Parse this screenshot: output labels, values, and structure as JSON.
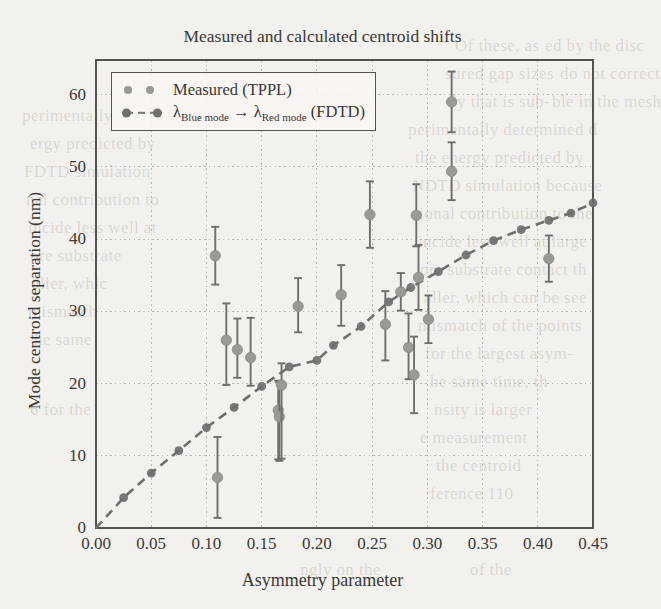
{
  "figure": {
    "title": "Measured and calculated centroid shifts",
    "xlabel": "Asymmetry parameter",
    "ylabel": "Mode centroid separation (nm)"
  },
  "legend": {
    "position": "upper-left",
    "entries": [
      {
        "label": "Measured (TPPL)",
        "marker": "circle",
        "color": "#9a9995"
      },
      {
        "label_pre": "λ",
        "label_sub1": "Blue mode",
        "label_mid": " → ",
        "label_lam2": "λ",
        "label_sub2": "Red mode",
        "label_post": " (FDTD)",
        "marker": "dashed-line-circle",
        "color": "#6f6e6b"
      }
    ]
  },
  "axes": {
    "xticks": [
      "0.00",
      "0.05",
      "0.10",
      "0.15",
      "0.20",
      "0.25",
      "0.30",
      "0.35",
      "0.40",
      "0.45"
    ],
    "yticks": [
      "0",
      "10",
      "20",
      "30",
      "40",
      "50",
      "60"
    ]
  },
  "colors": {
    "page_background": "#f3f1ed",
    "measured_marker": "#9a9995",
    "errorbar": "#6f6e6b",
    "fdtd_marker": "#6f6e6b",
    "fdtd_line": "#77766f",
    "frame": "#55534f",
    "grid": "#b9b7b1",
    "text": "#3a3936"
  },
  "chart_data": {
    "type": "scatter",
    "title": "Measured and calculated centroid shifts",
    "xlabel": "Asymmetry parameter",
    "ylabel": "Mode centroid separation (nm)",
    "xlim": [
      0.0,
      0.45
    ],
    "ylim": [
      0,
      65
    ],
    "grid": true,
    "legend_position": "upper-left",
    "series": [
      {
        "name": "Measured (TPPL)",
        "type": "scatter-errorbar",
        "marker": "circle",
        "color": "#9a9995",
        "points": [
          {
            "x": 0.108,
            "y": 37.7,
            "yerr_low": 4.0,
            "yerr_high": 4.0
          },
          {
            "x": 0.11,
            "y": 7.0,
            "yerr_low": 5.6,
            "yerr_high": 5.6
          },
          {
            "x": 0.118,
            "y": 26.0,
            "yerr_low": 6.2,
            "yerr_high": 5.1
          },
          {
            "x": 0.128,
            "y": 24.7,
            "yerr_low": 3.9,
            "yerr_high": 4.3
          },
          {
            "x": 0.14,
            "y": 23.6,
            "yerr_low": 3.9,
            "yerr_high": 5.5
          },
          {
            "x": 0.165,
            "y": 16.3,
            "yerr_low": 6.8,
            "yerr_high": 4.1
          },
          {
            "x": 0.166,
            "y": 15.4,
            "yerr_low": 6.1,
            "yerr_high": 4.8
          },
          {
            "x": 0.168,
            "y": 19.8,
            "yerr_low": 10.2,
            "yerr_high": 3.0
          },
          {
            "x": 0.183,
            "y": 30.7,
            "yerr_low": 3.6,
            "yerr_high": 3.9
          },
          {
            "x": 0.222,
            "y": 32.3,
            "yerr_low": 4.3,
            "yerr_high": 4.1
          },
          {
            "x": 0.248,
            "y": 43.4,
            "yerr_low": 4.6,
            "yerr_high": 4.6
          },
          {
            "x": 0.262,
            "y": 28.2,
            "yerr_low": 5.0,
            "yerr_high": 4.6
          },
          {
            "x": 0.276,
            "y": 32.7,
            "yerr_low": 2.6,
            "yerr_high": 2.6
          },
          {
            "x": 0.283,
            "y": 25.0,
            "yerr_low": 4.4,
            "yerr_high": 4.7
          },
          {
            "x": 0.288,
            "y": 21.2,
            "yerr_low": 5.3,
            "yerr_high": 5.3
          },
          {
            "x": 0.29,
            "y": 43.3,
            "yerr_low": 4.3,
            "yerr_high": 4.3
          },
          {
            "x": 0.292,
            "y": 34.7,
            "yerr_low": 4.5,
            "yerr_high": 4.5
          },
          {
            "x": 0.301,
            "y": 28.9,
            "yerr_low": 3.3,
            "yerr_high": 3.3
          },
          {
            "x": 0.322,
            "y": 59.0,
            "yerr_low": 4.2,
            "yerr_high": 4.2
          },
          {
            "x": 0.322,
            "y": 49.4,
            "yerr_low": 4.0,
            "yerr_high": 4.0
          },
          {
            "x": 0.41,
            "y": 37.3,
            "yerr_low": 3.2,
            "yerr_high": 3.2
          }
        ]
      },
      {
        "name": "λ Blue mode → λ Red mode (FDTD)",
        "type": "line-marker",
        "linestyle": "dashed",
        "marker": "circle",
        "color": "#6f6e6b",
        "points": [
          {
            "x": 0.0,
            "y": 0.0
          },
          {
            "x": 0.025,
            "y": 4.2
          },
          {
            "x": 0.05,
            "y": 7.6
          },
          {
            "x": 0.075,
            "y": 10.7
          },
          {
            "x": 0.1,
            "y": 13.9
          },
          {
            "x": 0.125,
            "y": 16.7
          },
          {
            "x": 0.15,
            "y": 19.6
          },
          {
            "x": 0.175,
            "y": 22.3
          },
          {
            "x": 0.2,
            "y": 23.2
          },
          {
            "x": 0.215,
            "y": 25.3
          },
          {
            "x": 0.24,
            "y": 27.9
          },
          {
            "x": 0.265,
            "y": 31.3
          },
          {
            "x": 0.285,
            "y": 33.3
          },
          {
            "x": 0.31,
            "y": 35.5
          },
          {
            "x": 0.335,
            "y": 37.8
          },
          {
            "x": 0.36,
            "y": 39.8
          },
          {
            "x": 0.385,
            "y": 41.3
          },
          {
            "x": 0.41,
            "y": 42.6
          },
          {
            "x": 0.43,
            "y": 43.6
          },
          {
            "x": 0.45,
            "y": 45.0
          }
        ]
      }
    ]
  },
  "bleed_text": [
    {
      "t": "Of these, as",
      "x": 455,
      "y": 36
    },
    {
      "t": "ed by the disc",
      "x": 545,
      "y": 36
    },
    {
      "t": "sured gap sizes",
      "x": 445,
      "y": 64
    },
    {
      "t": "do not correct",
      "x": 560,
      "y": 64
    },
    {
      "t": "ly that is sub-",
      "x": 452,
      "y": 92
    },
    {
      "t": "ble in the mesh",
      "x": 552,
      "y": 92
    },
    {
      "t": "perimentally determined d",
      "x": 408,
      "y": 120
    },
    {
      "t": "the energy predicted by",
      "x": 415,
      "y": 148
    },
    {
      "t": "NDTD simulation because",
      "x": 412,
      "y": 176
    },
    {
      "t": "tional contribution to the",
      "x": 414,
      "y": 204
    },
    {
      "t": "incide less well at large",
      "x": 418,
      "y": 232
    },
    {
      "t": "ore substrate contact th",
      "x": 420,
      "y": 260
    },
    {
      "t": "aller, which can be see",
      "x": 424,
      "y": 288
    },
    {
      "t": "mismatch of the points",
      "x": 418,
      "y": 316
    },
    {
      "t": "for the largest asym-",
      "x": 425,
      "y": 344
    },
    {
      "t": "he same time, th",
      "x": 430,
      "y": 372
    },
    {
      "t": "nsity is larger",
      "x": 434,
      "y": 400
    },
    {
      "t": "e measurement",
      "x": 420,
      "y": 428
    },
    {
      "t": "the centroid",
      "x": 436,
      "y": 456
    },
    {
      "t": "ference 110",
      "x": 430,
      "y": 484
    },
    {
      "t": "ngly on the",
      "x": 300,
      "y": 560
    },
    {
      "t": "of the",
      "x": 470,
      "y": 560
    },
    {
      "t": "perimentally",
      "x": 22,
      "y": 106
    },
    {
      "t": "ergy predicted by",
      "x": 30,
      "y": 134
    },
    {
      "t": "FDTD simulation",
      "x": 24,
      "y": 162
    },
    {
      "t": "nal contribution to",
      "x": 26,
      "y": 190
    },
    {
      "t": "incide less well at",
      "x": 28,
      "y": 218
    },
    {
      "t": "ore substrate",
      "x": 30,
      "y": 246
    },
    {
      "t": "aller, whic",
      "x": 32,
      "y": 274
    },
    {
      "t": "mismatch",
      "x": 28,
      "y": 302
    },
    {
      "t": "6 for the",
      "x": 30,
      "y": 400
    },
    {
      "t": "he same",
      "x": 34,
      "y": 330
    }
  ]
}
